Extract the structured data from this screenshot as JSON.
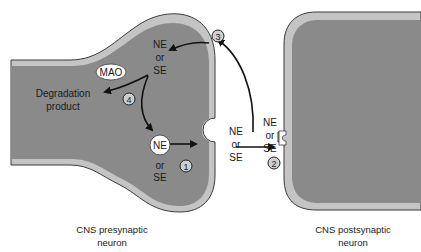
{
  "diagram": {
    "colors": {
      "cytoplasm": "#8a8a8a",
      "membrane": "#c4c4c4",
      "outline": "#3a3a3a",
      "background": "#ffffff",
      "arrow": "#111111"
    },
    "presynaptic": {
      "caption_line1": "CNS presynaptic",
      "caption_line2": "neuron"
    },
    "postsynaptic": {
      "caption_line1": "CNS postsynaptic",
      "caption_line2": "neuron"
    },
    "vesicle_label": {
      "line1": "NE",
      "line2": "or",
      "line3": "SE"
    },
    "reuptake_label": {
      "line1": "NE",
      "line2": "or",
      "line3": "SE"
    },
    "vesicle_inside": "NE",
    "vesicle_below": {
      "line1": "or",
      "line2": "SE"
    },
    "released_label": {
      "line1": "NE",
      "line2": "or",
      "line3": "SE"
    },
    "receptor_label": {
      "line1": "NE",
      "line2": "or",
      "line3": "SE"
    },
    "enzyme": "MAO",
    "degradation": {
      "line1": "Degradation",
      "line2": "product"
    },
    "steps": [
      "1",
      "2",
      "3",
      "4"
    ]
  }
}
